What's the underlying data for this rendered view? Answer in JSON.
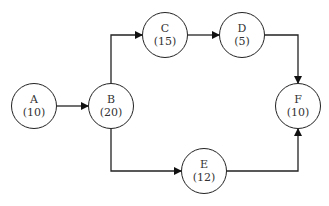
{
  "nodes": [
    {
      "id": "A",
      "label": "A",
      "duration": "(10)",
      "x": 34,
      "y": 106
    },
    {
      "id": "B",
      "label": "B",
      "duration": "(20)",
      "x": 111,
      "y": 106
    },
    {
      "id": "C",
      "label": "C",
      "duration": "(15)",
      "x": 165,
      "y": 35
    },
    {
      "id": "D",
      "label": "D",
      "duration": "(5)",
      "x": 242,
      "y": 35
    },
    {
      "id": "E",
      "label": "E",
      "duration": "(12)",
      "x": 204,
      "y": 171
    },
    {
      "id": "F",
      "label": "F",
      "duration": "(10)",
      "x": 298,
      "y": 106
    }
  ],
  "edges": [
    {
      "from": "A",
      "to": "B"
    },
    {
      "from": "B",
      "to": "C"
    },
    {
      "from": "C",
      "to": "D"
    },
    {
      "from": "D",
      "to": "F"
    },
    {
      "from": "B",
      "to": "E"
    },
    {
      "from": "E",
      "to": "F"
    }
  ]
}
